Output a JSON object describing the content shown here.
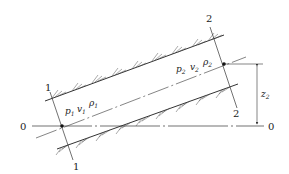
{
  "diagram": {
    "type": "inclined pipe flow, two cross-sections relative to datum",
    "section_1": {
      "label_top": "1",
      "label_bottom": "1",
      "pressure": "p",
      "pressure_sub": "1",
      "velocity": "v",
      "velocity_sub": "1",
      "density": "ρ",
      "density_sub": "1"
    },
    "section_2": {
      "label_top": "2",
      "label_bottom": "2",
      "pressure": "p",
      "pressure_sub": "2",
      "velocity": "v",
      "velocity_sub": "2",
      "density": "ρ",
      "density_sub": "2"
    },
    "datum": {
      "label_left": "0",
      "label_right": "0"
    },
    "elevation": {
      "symbol": "z",
      "sub": "2"
    },
    "colors": {
      "line": "#333333",
      "background": "#ffffff"
    }
  }
}
